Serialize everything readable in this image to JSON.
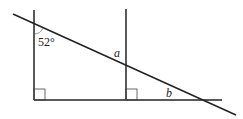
{
  "diagram": {
    "type": "geometry",
    "labels": {
      "angle_given": "52°",
      "angle_a": "a",
      "angle_b": "b"
    },
    "right_angles": 2,
    "colors": {
      "stroke": "#222222",
      "background": "#ffffff"
    }
  }
}
